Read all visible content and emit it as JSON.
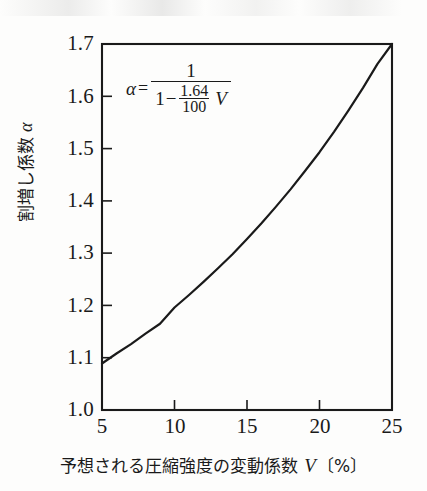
{
  "figure": {
    "background_color": "#fdfdfc",
    "ink_color": "#1a1a1a",
    "formula": {
      "lhs": "α",
      "equals": "=",
      "numerator": "1",
      "denominator_lead": "1",
      "denominator_minus": "−",
      "inner_numerator": "1.64",
      "inner_denominator": "100",
      "denominator_variable": "V"
    }
  },
  "axes": {
    "y_title": "割増し係数 ",
    "y_title_symbol": "α",
    "x_title": "予想される圧縮強度の変動係数 ",
    "x_title_symbol": "V",
    "x_title_unit": "〔%〕"
  },
  "chart_data": {
    "type": "line",
    "title": "",
    "xlabel": "予想される圧縮強度の変動係数 V〔%〕",
    "ylabel": "割増し係数 α",
    "xlim": [
      5,
      25
    ],
    "ylim": [
      1.0,
      1.7
    ],
    "xticks": [
      5,
      10,
      15,
      20,
      25
    ],
    "xtick_labels": [
      "5",
      "10",
      "15",
      "20",
      "25"
    ],
    "yticks": [
      1.0,
      1.1,
      1.2,
      1.3,
      1.4,
      1.5,
      1.6,
      1.7
    ],
    "ytick_labels": [
      "1.0",
      "1.1",
      "1.2",
      "1.3",
      "1.4",
      "1.5",
      "1.6",
      "1.7"
    ],
    "grid": false,
    "legend": "none",
    "tick_direction": "in",
    "equation": "α = 1 / (1 − (1.64/100) · V)",
    "series": [
      {
        "name": "α = 1/(1 − 1.64V/100)",
        "color": "#1a1a1a",
        "line_width": 2.2,
        "x": [
          5,
          6,
          7,
          8,
          9,
          10,
          11,
          12,
          13,
          14,
          15,
          16,
          17,
          18,
          19,
          20,
          21,
          22,
          23,
          24,
          25
        ],
        "y": [
          1.089,
          1.108,
          1.126,
          1.146,
          1.165,
          1.196,
          1.22,
          1.245,
          1.271,
          1.298,
          1.327,
          1.357,
          1.389,
          1.422,
          1.457,
          1.493,
          1.532,
          1.573,
          1.616,
          1.662,
          1.7
        ]
      }
    ],
    "annotations": [
      {
        "text": "α = 1 / (1 − (1.64/100) V)",
        "x": 8.5,
        "y": 1.62
      }
    ]
  }
}
